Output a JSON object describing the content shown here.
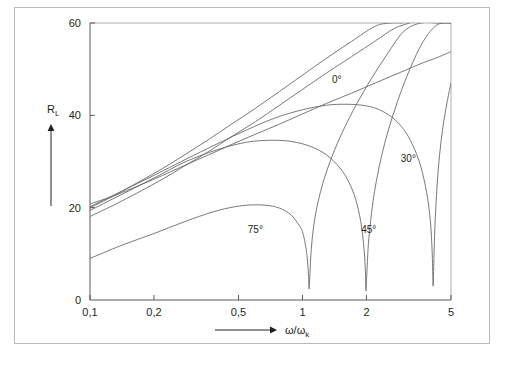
{
  "figure": {
    "frame_color": "#b9b9b9",
    "line_color": "#6a6a6c",
    "axis_color": "#58585a",
    "background": "#ffffff"
  },
  "caption": {
    "text": ""
  },
  "chart_data": {
    "type": "line",
    "title": "",
    "xlabel": "ω/ω",
    "xlabel_sub": "k",
    "ylabel": "R",
    "ylabel_sub": "L",
    "xscale": "log",
    "yscale": "linear",
    "xlim": [
      0.1,
      5
    ],
    "ylim": [
      0,
      60
    ],
    "grid": false,
    "legend_position": "inline-annotations",
    "xticks": [
      0.1,
      0.2,
      0.5,
      1,
      2,
      5
    ],
    "xticklabels": [
      "0,1",
      "0,2",
      "0,5",
      "1",
      "2",
      "5"
    ],
    "yticks": [
      0,
      20,
      40,
      60
    ],
    "yticklabels": [
      "0",
      "20",
      "40",
      "60"
    ],
    "annotations": [
      {
        "label": "0°",
        "x": 1.45,
        "y": 47.0
      },
      {
        "label": "30°",
        "x": 3.15,
        "y": 30.0
      },
      {
        "label": "45°",
        "x": 2.05,
        "y": 14.5
      },
      {
        "label": "75°",
        "x": 0.6,
        "y": 14.5
      }
    ],
    "series": [
      {
        "name": "0°",
        "x": [
          0.1,
          0.13,
          0.17,
          0.22,
          0.28,
          0.36,
          0.46,
          0.6,
          0.78,
          1.0,
          1.3,
          1.7,
          2.2,
          2.85,
          3.7,
          4.3,
          5.0
        ],
        "values": [
          20.8,
          22.6,
          24.8,
          27.0,
          29.2,
          31.4,
          33.6,
          35.9,
          38.1,
          40.3,
          42.6,
          44.8,
          47.0,
          49.2,
          51.4,
          52.5,
          53.8
        ]
      },
      {
        "name": "0°-upper",
        "x": [
          0.1,
          0.13,
          0.17,
          0.22,
          0.28,
          0.36,
          0.46,
          0.6,
          0.78,
          1.0,
          1.3,
          1.7,
          2.2,
          2.6,
          2.95
        ],
        "values": [
          20.0,
          22.6,
          25.6,
          28.5,
          31.5,
          34.7,
          38.0,
          41.5,
          45.2,
          48.7,
          52.4,
          56.0,
          59.3,
          60.0,
          60.0
        ]
      },
      {
        "name": "45°-rise",
        "x": [
          0.1,
          0.13,
          0.17,
          0.22,
          0.28,
          0.36,
          0.46,
          0.6,
          0.78,
          1.0,
          1.3,
          1.7,
          2.2,
          2.7,
          3.2
        ],
        "values": [
          18.1,
          20.6,
          23.4,
          26.2,
          29.1,
          32.1,
          35.3,
          38.6,
          42.2,
          45.6,
          49.2,
          52.7,
          56.1,
          58.8,
          60.0
        ]
      },
      {
        "name": "30°",
        "x": [
          0.1,
          0.14,
          0.2,
          0.28,
          0.4,
          0.55,
          0.75,
          1.0,
          1.3,
          1.6,
          1.9,
          2.15,
          2.4,
          2.7,
          3.0,
          3.3,
          3.6,
          3.85,
          4.0,
          4.08,
          4.12,
          4.16,
          4.22,
          4.35,
          4.55,
          4.8,
          5.0
        ],
        "values": [
          20.2,
          23.5,
          27.0,
          30.4,
          33.9,
          36.9,
          39.5,
          41.2,
          42.2,
          42.4,
          42.2,
          41.7,
          40.8,
          39.2,
          36.9,
          33.6,
          29.0,
          23.0,
          17.0,
          10.0,
          3.0,
          10.0,
          18.0,
          28.0,
          36.5,
          43.0,
          47.0
        ]
      },
      {
        "name": "45°",
        "x": [
          0.1,
          0.14,
          0.2,
          0.28,
          0.4,
          0.55,
          0.72,
          0.9,
          1.1,
          1.3,
          1.5,
          1.65,
          1.78,
          1.88,
          1.94,
          1.975,
          1.99,
          2.01,
          2.05,
          2.15,
          2.3,
          2.5,
          2.8,
          3.2,
          3.7,
          4.3,
          5.0
        ],
        "values": [
          19.4,
          22.8,
          26.4,
          29.9,
          32.6,
          34.2,
          34.6,
          34.3,
          33.2,
          31.4,
          28.6,
          25.6,
          21.8,
          17.0,
          12.0,
          7.0,
          2.0,
          6.0,
          13.0,
          21.5,
          29.0,
          35.8,
          43.0,
          50.0,
          56.0,
          59.6,
          60.0
        ]
      },
      {
        "name": "75°",
        "x": [
          0.1,
          0.14,
          0.2,
          0.28,
          0.38,
          0.48,
          0.58,
          0.68,
          0.78,
          0.88,
          0.96,
          1.0,
          1.03,
          1.05,
          1.065,
          1.075,
          1.085,
          1.1,
          1.13,
          1.18,
          1.26,
          1.38,
          1.55,
          1.8,
          2.1,
          2.5,
          3.0,
          3.6,
          4.3,
          5.0
        ],
        "values": [
          9.0,
          11.8,
          14.4,
          17.0,
          19.1,
          20.2,
          20.6,
          20.5,
          19.9,
          18.5,
          16.3,
          14.8,
          12.2,
          9.6,
          6.2,
          2.4,
          6.0,
          11.0,
          16.2,
          21.0,
          26.0,
          31.2,
          36.6,
          42.5,
          47.8,
          53.2,
          58.2,
          60.0,
          60.0,
          60.0
        ]
      }
    ]
  }
}
